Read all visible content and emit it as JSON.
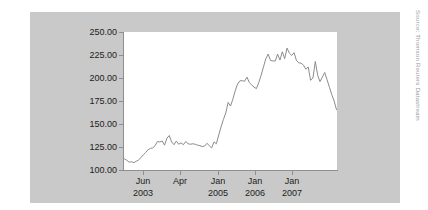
{
  "figure": {
    "source_note": "Source: Thomson Reuters Datastream",
    "panel_color": "#c9c9c9",
    "plot_background": "#ffffff",
    "line_color": "#8c8c8c",
    "axis_color": "#8f8f8f",
    "text_color": "#1c1c1c"
  },
  "chart_data": {
    "type": "line",
    "title": "",
    "xlabel": "",
    "ylabel": "",
    "grid": false,
    "legend": "none",
    "ylim": [
      100.0,
      250.0
    ],
    "ytick_labels": [
      "250.00",
      "225.00",
      "200.00",
      "175.00",
      "150.00",
      "125.00",
      "100.00"
    ],
    "ytick_values": [
      250.0,
      225.0,
      200.0,
      175.0,
      150.0,
      125.0,
      100.0
    ],
    "xtick_labels": [
      {
        "month": "Jun",
        "year": "2003"
      },
      {
        "month": "Apr",
        "year": ""
      },
      {
        "month": "Jan",
        "year": "2005"
      },
      {
        "month": "Jan",
        "year": "2006"
      },
      {
        "month": "Jan",
        "year": "2007"
      }
    ],
    "xtick_positions": [
      143,
      180,
      218,
      255,
      292
    ],
    "x_range_index": [
      0,
      79
    ],
    "series": [
      {
        "name": "Index",
        "values": [
          112.0,
          110.5,
          108.5,
          109.0,
          108.0,
          109.5,
          111.0,
          113.5,
          116.5,
          119.0,
          122.0,
          123.5,
          124.0,
          126.5,
          131.0,
          130.5,
          131.5,
          127.0,
          134.5,
          137.5,
          130.5,
          127.5,
          131.5,
          128.0,
          129.5,
          127.5,
          131.0,
          128.5,
          128.0,
          128.5,
          128.0,
          127.0,
          126.5,
          125.5,
          126.0,
          129.0,
          126.5,
          124.0,
          130.5,
          128.5,
          138.0,
          147.0,
          155.0,
          162.0,
          173.5,
          169.5,
          177.0,
          186.0,
          193.5,
          197.0,
          197.0,
          196.5,
          201.0,
          195.0,
          192.5,
          190.0,
          188.5,
          195.0,
          203.0,
          212.0,
          221.0,
          226.0,
          219.0,
          218.5,
          218.5,
          226.0,
          219.5,
          228.5,
          221.0,
          232.5,
          227.0,
          224.5,
          227.5,
          219.0,
          216.5,
          216.0,
          214.0,
          209.5,
          212.0,
          197.5,
          200.0,
          218.0,
          203.0,
          196.0,
          201.0,
          206.0,
          198.0,
          190.0,
          182.0,
          175.0,
          165.5
        ]
      }
    ]
  }
}
